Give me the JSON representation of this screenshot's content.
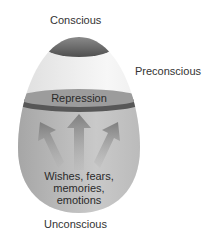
{
  "diagram": {
    "labels": {
      "conscious": "Conscious",
      "preconscious": "Preconscious",
      "repression": "Repression",
      "unconscious_contents": [
        "Wishes, fears,",
        "memories,",
        "emotions"
      ],
      "unconscious": "Unconscious"
    },
    "colors": {
      "cap_dark": "#5e5e5e",
      "preconscious_fill": "#efefef",
      "repression_band": "#9a9a9a",
      "repression_ring": "#555555",
      "unconscious_fill": "#b5b5b5",
      "arrow": "#8a8a8a",
      "text": "#333333"
    },
    "arrows": [
      {
        "direction": "up-left"
      },
      {
        "direction": "up"
      },
      {
        "direction": "up-right"
      }
    ]
  }
}
